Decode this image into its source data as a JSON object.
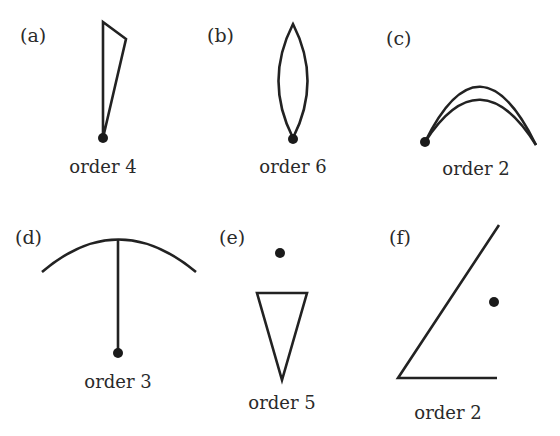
{
  "figures": [
    {
      "id": "a",
      "label": "(a)",
      "caption": "order 4",
      "shape": "thin-triangle-with-dot-at-bottom-vertex"
    },
    {
      "id": "b",
      "label": "(b)",
      "caption": "order 6",
      "shape": "lens-with-dot-at-bottom-tip"
    },
    {
      "id": "c",
      "label": "(c)",
      "caption": "order 2",
      "shape": "crescent-arc-with-dot-at-left-end"
    },
    {
      "id": "d",
      "label": "(d)",
      "caption": "order 3",
      "shape": "arc-with-vertical-stem-and-dot"
    },
    {
      "id": "e",
      "label": "(e)",
      "caption": "order 5",
      "shape": "inverted-triangle-with-dot-above"
    },
    {
      "id": "f",
      "label": "(f)",
      "caption": "order 2",
      "shape": "angle-with-dot-inside"
    }
  ],
  "colors": {
    "ink": "#222222",
    "background": "#ffffff"
  }
}
